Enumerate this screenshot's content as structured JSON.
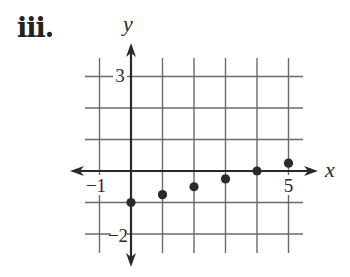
{
  "problem_label": "iii.",
  "chart_data": {
    "type": "scatter",
    "title": "",
    "xlabel": "x",
    "ylabel": "y",
    "xlim": [
      -1,
      5
    ],
    "ylim": [
      -2,
      3
    ],
    "grid": true,
    "x_tick_labels": [
      "-1",
      "5"
    ],
    "y_tick_labels": [
      "3",
      "-2"
    ],
    "points": [
      {
        "x": 0,
        "y": -1
      },
      {
        "x": 1,
        "y": -0.75
      },
      {
        "x": 2,
        "y": -0.5
      },
      {
        "x": 3,
        "y": -0.25
      },
      {
        "x": 4,
        "y": 0
      },
      {
        "x": 5,
        "y": 0.25
      }
    ],
    "colors": {
      "grid": "#6a6a6a",
      "axis": "#2a2a2a",
      "point": "#2a2a2a"
    }
  }
}
